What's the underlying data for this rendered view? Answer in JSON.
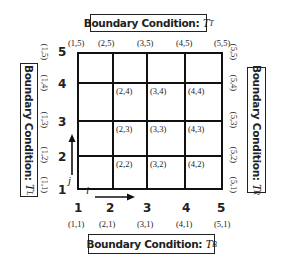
{
  "boundaries": {
    "top": {
      "label": "Boundary Condition: ",
      "symbol": "T",
      "sub": "T"
    },
    "bottom": {
      "label": "Boundary Condition: ",
      "symbol": "T",
      "sub": "B"
    },
    "left": {
      "label": "Boundary Condition: ",
      "symbol": "T",
      "sub": "L"
    },
    "right": {
      "label": "Boundary Condition: ",
      "symbol": "T",
      "sub": "R"
    }
  },
  "axes": {
    "i_label": "i",
    "j_label": "j",
    "x_ticks": [
      "1",
      "2",
      "3",
      "4",
      "5"
    ],
    "y_ticks": [
      "1",
      "2",
      "3",
      "4",
      "5"
    ]
  },
  "top_nodes": [
    "(1,5)",
    "(2,5)",
    "(3,5)",
    "(4,5)",
    "(5,5)"
  ],
  "bottom_nodes": [
    "(1,1)",
    "(2,1)",
    "(3,1)",
    "(4,1)",
    "(5,1)"
  ],
  "left_nodes": [
    "(1,1)",
    "(1,2)",
    "(1,3)",
    "(1,4)",
    "(1,5)"
  ],
  "right_nodes": [
    "(5,1)",
    "(5,2)",
    "(5,3)",
    "(5,4)",
    "(5,5)"
  ],
  "interior_nodes": {
    "row4": [
      "(2,4)",
      "(3,4)",
      "(4,4)"
    ],
    "row3": [
      "(2,3)",
      "(3,3)",
      "(4,3)"
    ],
    "row2": [
      "(2,2)",
      "(3,2)",
      "(4,2)"
    ]
  }
}
